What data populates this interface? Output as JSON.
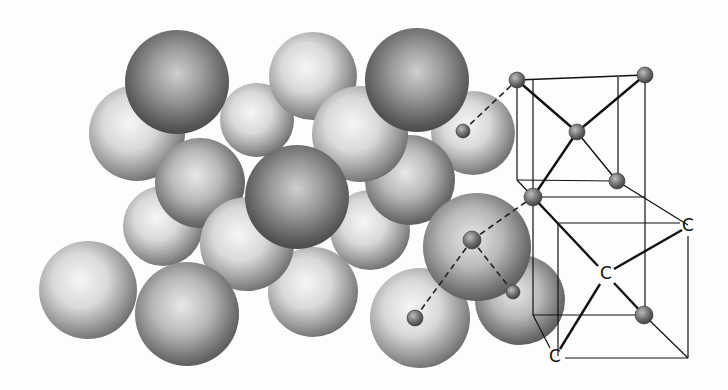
{
  "figure": {
    "labels": [
      {
        "id": "c-right",
        "text": "C",
        "x": 688,
        "y": 231
      },
      {
        "id": "c-center",
        "text": "C",
        "x": 606,
        "y": 279
      },
      {
        "id": "c-bottom",
        "text": "C",
        "x": 555,
        "y": 362
      }
    ],
    "colors": {
      "background": "#fdfdfd",
      "line": "#111111",
      "sphere_light": "#f2f2f2",
      "sphere_dark": "#4a4a4a"
    },
    "spheres": [
      {
        "cx": 88,
        "cy": 290,
        "r": 49,
        "tone": "light"
      },
      {
        "cx": 137,
        "cy": 133,
        "r": 48,
        "tone": "light"
      },
      {
        "cx": 163,
        "cy": 226,
        "r": 40,
        "tone": "light"
      },
      {
        "cx": 257,
        "cy": 120,
        "r": 37,
        "tone": "light"
      },
      {
        "cx": 313,
        "cy": 76,
        "r": 44,
        "tone": "light"
      },
      {
        "cx": 473,
        "cy": 133,
        "r": 42,
        "tone": "light"
      },
      {
        "cx": 370,
        "cy": 230,
        "r": 40,
        "tone": "light"
      },
      {
        "cx": 313,
        "cy": 292,
        "r": 45,
        "tone": "light"
      },
      {
        "cx": 410,
        "cy": 180,
        "r": 45,
        "tone": "mid"
      },
      {
        "cx": 360,
        "cy": 134,
        "r": 48,
        "tone": "light"
      },
      {
        "cx": 200,
        "cy": 183,
        "r": 45,
        "tone": "mid"
      },
      {
        "cx": 520,
        "cy": 300,
        "r": 45,
        "tone": "mid"
      },
      {
        "cx": 420,
        "cy": 318,
        "r": 50,
        "tone": "light"
      },
      {
        "cx": 247,
        "cy": 244,
        "r": 47,
        "tone": "light"
      },
      {
        "cx": 177,
        "cy": 82,
        "r": 52,
        "tone": "dark"
      },
      {
        "cx": 417,
        "cy": 80,
        "r": 52,
        "tone": "dark"
      },
      {
        "cx": 297,
        "cy": 197,
        "r": 52,
        "tone": "dark"
      },
      {
        "cx": 187,
        "cy": 314,
        "r": 52,
        "tone": "mid"
      },
      {
        "cx": 477,
        "cy": 247,
        "r": 54,
        "tone": "mid"
      }
    ],
    "atoms": [
      {
        "cx": 463,
        "cy": 131,
        "r": 7
      },
      {
        "cx": 517,
        "cy": 80,
        "r": 8
      },
      {
        "cx": 645,
        "cy": 75,
        "r": 8
      },
      {
        "cx": 577,
        "cy": 132,
        "r": 8
      },
      {
        "cx": 617,
        "cy": 181,
        "r": 8
      },
      {
        "cx": 533,
        "cy": 197,
        "r": 9
      },
      {
        "cx": 472,
        "cy": 240,
        "r": 9
      },
      {
        "cx": 513,
        "cy": 292,
        "r": 7
      },
      {
        "cx": 415,
        "cy": 318,
        "r": 8
      },
      {
        "cx": 644,
        "cy": 315,
        "r": 9
      }
    ]
  }
}
